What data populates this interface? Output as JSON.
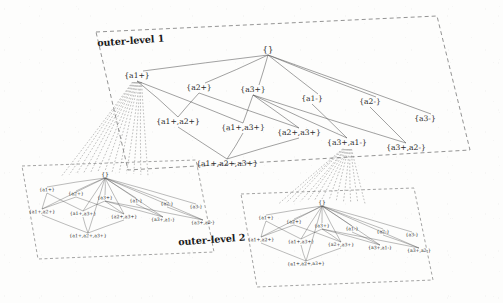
{
  "figure": {
    "type": "nested-lattice-diagram",
    "background_color": "#fdfdfc",
    "ink_color": "#2b2b2b",
    "labels": {
      "outer_level_1": "outer-level 1",
      "outer_level_2": "outer-level 2"
    }
  },
  "outer_lattice": {
    "root": {
      "label": "{}",
      "x": 268,
      "y": 50
    },
    "nodes": [
      {
        "label": "{a1+}",
        "x": 137,
        "y": 76
      },
      {
        "label": "{a2+}",
        "x": 199,
        "y": 88
      },
      {
        "label": "{a3+}",
        "x": 253,
        "y": 90
      },
      {
        "label": "{a1-}",
        "x": 312,
        "y": 99
      },
      {
        "label": "{a2-}",
        "x": 370,
        "y": 102
      },
      {
        "label": "{a3-}",
        "x": 425,
        "y": 119
      },
      {
        "label": "{a1+,a2+}",
        "x": 178,
        "y": 122
      },
      {
        "label": "{a1+,a3+}",
        "x": 243,
        "y": 128
      },
      {
        "label": "{a2+,a3+}",
        "x": 299,
        "y": 133
      },
      {
        "label": "{a3+,a1-}",
        "x": 347,
        "y": 143
      },
      {
        "label": "{a3+,a2-}",
        "x": 406,
        "y": 148
      },
      {
        "label": "{a1+,a2+,a3+}",
        "x": 227,
        "y": 164
      }
    ],
    "edges_from_root": [
      "{a1+}",
      "{a2+}",
      "{a3+}",
      "{a1-}",
      "{a2-}",
      "{a3-}"
    ],
    "cover_edges": [
      [
        "{a1+}",
        "{a1+,a2+}"
      ],
      [
        "{a1+}",
        "{a1+,a3+}"
      ],
      [
        "{a2+}",
        "{a1+,a2+}"
      ],
      [
        "{a2+}",
        "{a2+,a3+}"
      ],
      [
        "{a3+}",
        "{a1+,a3+}"
      ],
      [
        "{a3+}",
        "{a2+,a3+}"
      ],
      [
        "{a3+}",
        "{a3+,a1-}"
      ],
      [
        "{a3+}",
        "{a3+,a2-}"
      ],
      [
        "{a1-}",
        "{a3+,a1-}"
      ],
      [
        "{a2-}",
        "{a3+,a2-}"
      ],
      [
        "{a1+,a2+}",
        "{a1+,a2+,a3+}"
      ],
      [
        "{a1+,a3+}",
        "{a1+,a2+,a3+}"
      ],
      [
        "{a2+,a3+}",
        "{a1+,a2+,a3+}"
      ]
    ]
  },
  "inner_lattice_left": {
    "parent_node": "{a1+}",
    "root": {
      "label": "{}",
      "x": 105,
      "y": 175
    },
    "nodes": [
      {
        "label": "{a1+}",
        "x": 47,
        "y": 190
      },
      {
        "label": "{a2+}",
        "x": 76,
        "y": 194
      },
      {
        "label": "{a3+}",
        "x": 105,
        "y": 198
      },
      {
        "label": "{a1-}",
        "x": 136,
        "y": 201
      },
      {
        "label": "{a2-}",
        "x": 167,
        "y": 204
      },
      {
        "label": "{a3-}",
        "x": 196,
        "y": 207
      },
      {
        "label": "{a1+,a2+}",
        "x": 42,
        "y": 212
      },
      {
        "label": "{a1+,a3+}",
        "x": 83,
        "y": 214
      },
      {
        "label": "{a2+,a3+}",
        "x": 124,
        "y": 217
      },
      {
        "label": "{a3+,a1-}",
        "x": 163,
        "y": 220
      },
      {
        "label": "{a3+,a2-}",
        "x": 203,
        "y": 223
      },
      {
        "label": "{a1+,a2+,a3+}",
        "x": 88,
        "y": 236
      }
    ]
  },
  "inner_lattice_right": {
    "parent_node": "{a3+,a1-}",
    "root": {
      "label": "{}",
      "x": 322,
      "y": 203
    },
    "nodes": [
      {
        "label": "{a1+}",
        "x": 266,
        "y": 218
      },
      {
        "label": "{a2+}",
        "x": 294,
        "y": 222
      },
      {
        "label": "{a3+}",
        "x": 322,
        "y": 226
      },
      {
        "label": "{a1-}",
        "x": 352,
        "y": 229
      },
      {
        "label": "{a2-}",
        "x": 383,
        "y": 232
      },
      {
        "label": "{a3-}",
        "x": 412,
        "y": 235
      },
      {
        "label": "{a1+,a2+}",
        "x": 261,
        "y": 240
      },
      {
        "label": "{a1+,a3+}",
        "x": 301,
        "y": 242
      },
      {
        "label": "{a2+,a3+}",
        "x": 341,
        "y": 245
      },
      {
        "label": "{a3+,a1-}",
        "x": 380,
        "y": 248
      },
      {
        "label": "{a3+,a2-}",
        "x": 419,
        "y": 251
      },
      {
        "label": "{a1+,a2+,a3+}",
        "x": 306,
        "y": 264
      }
    ]
  },
  "boundaries": {
    "outer": "M96,32 L437,16 L470,150 L128,170 Z",
    "inner_left": "M22,166 L196,160 L214,252 L38,259 Z",
    "inner_right": "M241,194 L414,188 L433,280 L257,287 Z"
  },
  "level_label_positions": {
    "outer_level_1": {
      "x": 131,
      "y": 44,
      "rotate": -4
    },
    "outer_level_2": {
      "x": 212,
      "y": 243,
      "rotate": -4
    }
  }
}
